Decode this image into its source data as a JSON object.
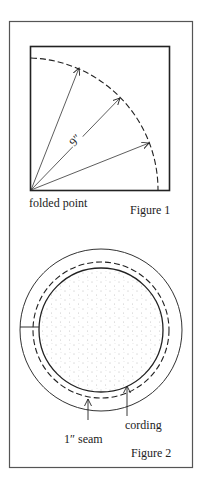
{
  "figure1": {
    "caption": "Figure 1",
    "folded_point_label": "folded point",
    "radius_label": "9″"
  },
  "figure2": {
    "caption": "Figure 2",
    "seam_label": "1″ seam",
    "cording_label": "cording"
  },
  "colors": {
    "line": "#222222",
    "frame": "#555555"
  }
}
